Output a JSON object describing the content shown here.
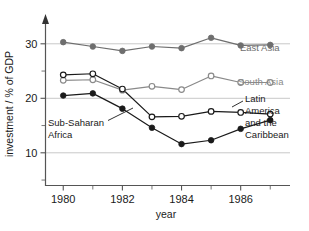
{
  "chart_data": {
    "type": "line",
    "title": "",
    "xlabel": "year",
    "ylabel": "investment / % of GDP",
    "x": [
      1980,
      1981,
      1982,
      1983,
      1984,
      1985,
      1986,
      1987
    ],
    "xlim": [
      1979.4,
      1987.6
    ],
    "ylim": [
      4,
      34
    ],
    "xticks_labeled": [
      "1980",
      "1982",
      "1984",
      "1986"
    ],
    "xticks_labeled_values": [
      1980,
      1982,
      1984,
      1986
    ],
    "xticks_minor_values": [
      1981,
      1983,
      1985,
      1987
    ],
    "yticks_labeled": [
      "10",
      "20",
      "30"
    ],
    "yticks_labeled_values": [
      10,
      20,
      30
    ],
    "yticks_minor_values": [
      5,
      15,
      25
    ],
    "grid": "horizontal-at-labeled-y",
    "legend": "inline-annotations",
    "series": [
      {
        "name": "East Asia",
        "marker": "filled-circle",
        "color": "#6e6e6e",
        "values": [
          30.3,
          29.5,
          28.7,
          29.5,
          29.2,
          31.1,
          29.7,
          29.8
        ]
      },
      {
        "name": "South Asia",
        "marker": "open-circle",
        "color": "#8a8a8a",
        "values": [
          23.3,
          23.4,
          21.5,
          22.2,
          21.6,
          24.1,
          22.9,
          22.9
        ]
      },
      {
        "name": "Latin America and the Caribbean",
        "marker": "open-circle",
        "color": "#1a1a1a",
        "values": [
          24.3,
          24.5,
          21.7,
          16.6,
          16.7,
          17.6,
          17.4,
          17.1
        ]
      },
      {
        "name": "Sub-Saharan Africa",
        "marker": "filled-circle",
        "color": "#1a1a1a",
        "values": [
          20.5,
          20.9,
          18.1,
          14.6,
          11.6,
          12.3,
          14.4,
          16.0
        ]
      }
    ]
  },
  "annotations": {
    "east_asia": "East Asia",
    "south_asia": "South Asia",
    "latin_america_lines": [
      "Latin",
      "America",
      "and the",
      "Caribbean"
    ],
    "sub_saharan_lines": [
      "Sub-Saharan",
      "Africa"
    ]
  },
  "axes": {
    "x_title": "year",
    "y_title": "investment / % of GDP",
    "x_tick_labels": [
      "1980",
      "1982",
      "1984",
      "1986"
    ],
    "y_tick_labels": [
      "10",
      "20",
      "30"
    ]
  },
  "colors": {
    "east_asia": "#6e6e6e",
    "south_asia": "#8a8a8a",
    "latin_america": "#1a1a1a",
    "sub_saharan": "#1a1a1a",
    "grid": "#c8c8c8",
    "axis": "#555555",
    "background": "#ffffff"
  }
}
